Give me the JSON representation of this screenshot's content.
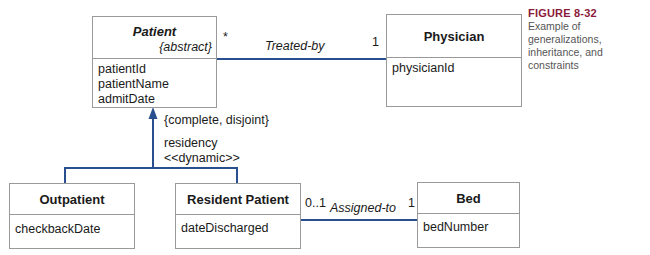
{
  "figure": {
    "number": "FIGURE 8-32",
    "caption": "Example of generalizations, inheritance, and constraints"
  },
  "classes": {
    "patient": {
      "name": "Patient",
      "stereotype": "{abstract}",
      "attributes": [
        "patientId",
        "patientName",
        "admitDate"
      ]
    },
    "physician": {
      "name": "Physician",
      "attributes": [
        "physicianId"
      ]
    },
    "outpatient": {
      "name": "Outpatient",
      "attributes": [
        "checkbackDate"
      ]
    },
    "resident_patient": {
      "name": "Resident Patient",
      "attributes": [
        "dateDischarged"
      ]
    },
    "bed": {
      "name": "Bed",
      "attributes": [
        "bedNumber"
      ]
    }
  },
  "associations": {
    "treated_by": {
      "label": "Treated-by",
      "source_multiplicity": "*",
      "target_multiplicity": "1"
    },
    "assigned_to": {
      "label": "Assigned-to",
      "source_multiplicity": "0..1",
      "target_multiplicity": "1"
    }
  },
  "generalization": {
    "constraint": "{complete, disjoint}",
    "discriminator": "residency",
    "stereotype": "<<dynamic>>"
  },
  "colors": {
    "line": "#2a4f8f",
    "box_border": "#9a9a9a",
    "caption_title": "#8b1a3a"
  }
}
